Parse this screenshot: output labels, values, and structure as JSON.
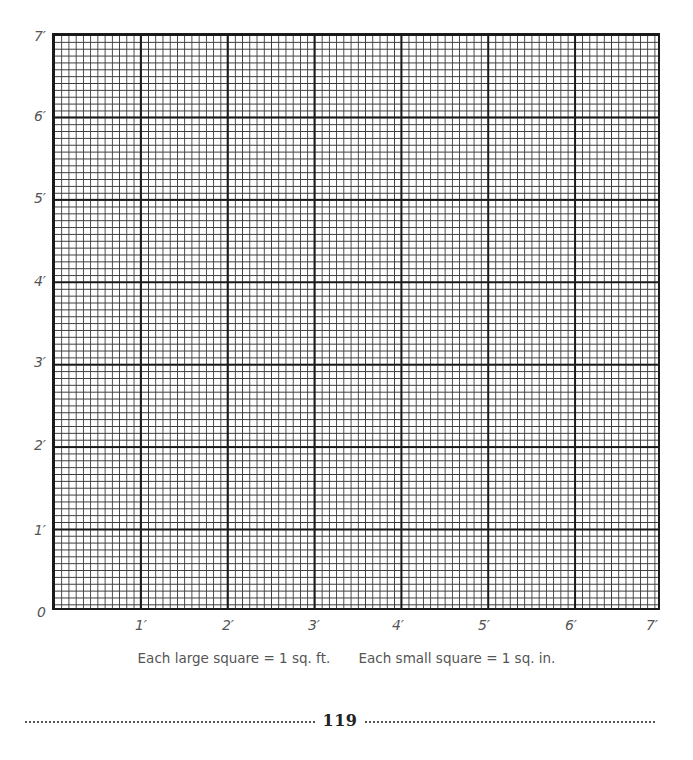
{
  "grid": {
    "size_feet": 7,
    "minor_per_major": 12,
    "line_color": "#1a1a1a",
    "y_labels": [
      {
        "text": "7′",
        "value": 7
      },
      {
        "text": "6′",
        "value": 6
      },
      {
        "text": "5′",
        "value": 5
      },
      {
        "text": "4′",
        "value": 4
      },
      {
        "text": "3′",
        "value": 3
      },
      {
        "text": "2′",
        "value": 2
      },
      {
        "text": "1′",
        "value": 1
      },
      {
        "text": "0",
        "value": 0
      }
    ],
    "x_labels": [
      {
        "text": "1′",
        "value": 1
      },
      {
        "text": "2′",
        "value": 2
      },
      {
        "text": "3′",
        "value": 3
      },
      {
        "text": "4′",
        "value": 4
      },
      {
        "text": "5′",
        "value": 5
      },
      {
        "text": "6′",
        "value": 6
      },
      {
        "text": "7′",
        "value": 7
      }
    ]
  },
  "caption": {
    "large": "Each large square = 1 sq. ft.",
    "small": "Each small square = 1 sq. in."
  },
  "footer": {
    "page_number": "119"
  }
}
